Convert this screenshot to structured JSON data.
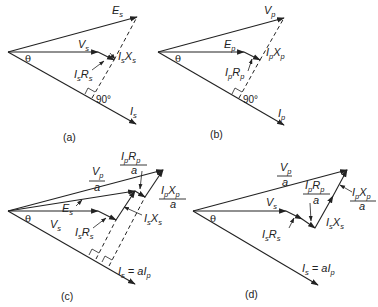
{
  "figure": {
    "panels": [
      {
        "id": "a",
        "caption": "(a)",
        "labels": {
          "top": {
            "main": "E",
            "sub": "s"
          },
          "mid": {
            "main": "V",
            "sub": "s"
          },
          "reactance": {
            "a": "I",
            "asub": "s",
            "b": "X",
            "bsub": "s"
          },
          "resistance": {
            "a": "I",
            "asub": "s",
            "b": "R",
            "bsub": "s"
          },
          "current": {
            "main": "I",
            "sub": "s"
          },
          "angle": "θ",
          "right_angle": "90°"
        }
      },
      {
        "id": "b",
        "caption": "(b)",
        "labels": {
          "top": {
            "main": "V",
            "sub": "p"
          },
          "mid": {
            "main": "E",
            "sub": "p"
          },
          "reactance": {
            "a": "I",
            "asub": "p",
            "b": "X",
            "bsub": "p"
          },
          "resistance": {
            "a": "I",
            "asub": "p",
            "b": "R",
            "bsub": "p"
          },
          "current": {
            "main": "I",
            "sub": "p"
          },
          "angle": "θ",
          "right_angle": "90°"
        }
      },
      {
        "id": "c",
        "caption": "(c)",
        "labels": {
          "vp_num": {
            "main": "V",
            "sub": "p"
          },
          "vp_den": "a",
          "iprp_num": {
            "a": "I",
            "asub": "p",
            "b": "R",
            "bsub": "p"
          },
          "iprp_den": "a",
          "ipxp_num": {
            "a": "I",
            "asub": "p",
            "b": "X",
            "bsub": "p"
          },
          "ipxp_den": "a",
          "es": {
            "main": "E",
            "sub": "s"
          },
          "vs": {
            "main": "V",
            "sub": "s"
          },
          "isrs": {
            "a": "I",
            "asub": "s",
            "b": "R",
            "bsub": "s"
          },
          "isxs": {
            "a": "I",
            "asub": "s",
            "b": "X",
            "bsub": "s"
          },
          "current": {
            "a": "I",
            "asub": "s",
            "eq": " = a",
            "b": "I",
            "bsub": "p"
          },
          "angle": "θ"
        }
      },
      {
        "id": "d",
        "caption": "(d)",
        "labels": {
          "vp_num": {
            "main": "V",
            "sub": "p"
          },
          "vp_den": "a",
          "iprp_num": {
            "a": "I",
            "asub": "p",
            "b": "R",
            "bsub": "p"
          },
          "iprp_den": "a",
          "ipxp_num": {
            "a": "I",
            "asub": "p",
            "b": "X",
            "bsub": "p"
          },
          "ipxp_den": "a",
          "vs": {
            "main": "V",
            "sub": "s"
          },
          "isrs": {
            "a": "I",
            "asub": "s",
            "b": "R",
            "bsub": "s"
          },
          "isxs": {
            "a": "I",
            "asub": "s",
            "b": "X",
            "bsub": "s"
          },
          "current": {
            "a": "I",
            "asub": "s",
            "eq": " = a",
            "b": "I",
            "bsub": "p"
          },
          "angle": "θ"
        }
      }
    ],
    "colors": {
      "stroke": "#222222",
      "background": "#ffffff"
    }
  }
}
